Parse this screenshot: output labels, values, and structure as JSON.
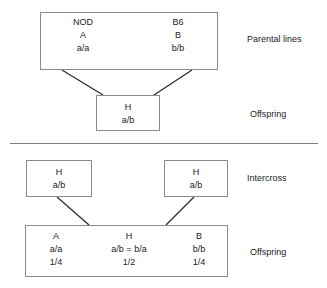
{
  "diagram": {
    "line_color": "#8a8a8a",
    "text_color": "#1a1a1a",
    "background": "#ffffff",
    "sections": {
      "parental": {
        "stage_label": "Parental lines",
        "strains": [
          {
            "strain": "NOD",
            "genotype_letter": "A",
            "alleles": "a/a"
          },
          {
            "strain": "B6",
            "genotype_letter": "B",
            "alleles": "b/b"
          }
        ]
      },
      "f1": {
        "stage_label": "Offspring",
        "genotype_letter": "H",
        "alleles": "a/b"
      },
      "intercross": {
        "stage_label": "Intercross",
        "parents": [
          {
            "genotype_letter": "H",
            "alleles": "a/b"
          },
          {
            "genotype_letter": "H",
            "alleles": "a/b"
          }
        ]
      },
      "f2": {
        "stage_label": "Offspring",
        "classes": [
          {
            "genotype_letter": "A",
            "alleles": "a/a",
            "frequency": "1/4"
          },
          {
            "genotype_letter": "H",
            "alleles": "a/b = b/a",
            "frequency": "1/2"
          },
          {
            "genotype_letter": "B",
            "alleles": "b/b",
            "frequency": "1/4"
          }
        ]
      }
    }
  }
}
